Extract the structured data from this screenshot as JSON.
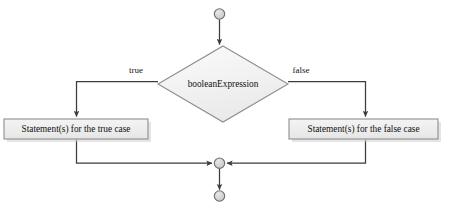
{
  "diagram": {
    "type": "flowchart",
    "canvas": {
      "width": 450,
      "height": 211,
      "background": "#ffffff"
    },
    "palette": {
      "connector": "#3c3c3c",
      "shape_border": "#8e8e8e",
      "diamond_fill": "#f2f2f2",
      "box_fill": "#ededed",
      "terminator_fill": "#d4d4d4",
      "shadow": "#c8c8c8",
      "text": "#111111"
    },
    "nodes": {
      "start": {
        "name": "start-terminator",
        "shape": "circle",
        "cx": 219,
        "cy": 14,
        "r": 5.2
      },
      "condition": {
        "name": "condition-diamond",
        "shape": "diamond",
        "label": "booleanExpression",
        "cx": 223,
        "cy": 84,
        "half_width": 65,
        "half_height": 38
      },
      "true_branch": {
        "name": "true-statement-box",
        "shape": "rect",
        "label": "Statement(s) for the true case",
        "x": 4,
        "y": 119,
        "width": 144,
        "height": 20
      },
      "false_branch": {
        "name": "false-statement-box",
        "shape": "rect",
        "label": "Statement(s) for the false case",
        "x": 289,
        "y": 119,
        "width": 149,
        "height": 20
      },
      "merge": {
        "name": "merge-node",
        "shape": "circle",
        "cx": 219,
        "cy": 163,
        "r": 5.2
      },
      "end": {
        "name": "end-terminator",
        "shape": "circle",
        "cx": 219,
        "cy": 196,
        "r": 5.2
      }
    },
    "edge_labels": {
      "true": {
        "text": "true",
        "x": 136,
        "y": 73
      },
      "false": {
        "text": "false",
        "x": 301,
        "y": 73
      }
    },
    "edges": [
      {
        "name": "start-to-condition",
        "from": "start",
        "to": "condition",
        "arrow": true
      },
      {
        "name": "condition-to-true-branch",
        "from": "condition",
        "to": "true_branch",
        "label": "true",
        "arrow": true
      },
      {
        "name": "condition-to-false-branch",
        "from": "condition",
        "to": "false_branch",
        "label": "false",
        "arrow": true
      },
      {
        "name": "true-branch-to-merge",
        "from": "true_branch",
        "to": "merge",
        "arrow": true
      },
      {
        "name": "false-branch-to-merge",
        "from": "false_branch",
        "to": "merge",
        "arrow": true
      },
      {
        "name": "merge-to-end",
        "from": "merge",
        "to": "end",
        "arrow": true
      }
    ]
  }
}
